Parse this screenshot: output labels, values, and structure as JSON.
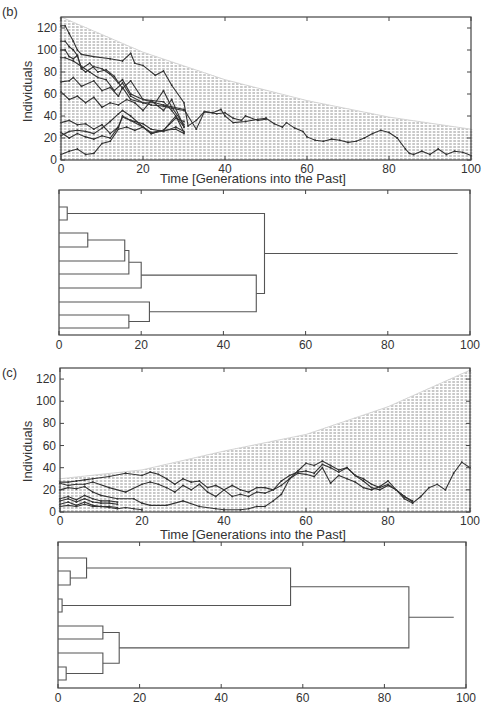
{
  "chart_data": [
    {
      "id": "b-lineages",
      "type": "line",
      "panel_label": "(b)",
      "title": "",
      "xlabel": "Time [Generations into the Past]",
      "ylabel": "Individuals",
      "xlim": [
        0,
        100
      ],
      "ylim": [
        0,
        130
      ],
      "xticks": [
        0,
        20,
        40,
        60,
        80,
        100
      ],
      "yticks": [
        0,
        20,
        40,
        60,
        80,
        100,
        120
      ],
      "background_envelope": {
        "description": "Gray vertical hatching showing population size per generation (decreasing into the past)",
        "x": [
          0,
          20,
          40,
          60,
          80,
          100
        ],
        "upper": [
          130,
          98,
          73,
          54,
          39,
          28
        ]
      },
      "series": [
        {
          "name": "lineage-1",
          "x": [
            0,
            1,
            2,
            3,
            4,
            5,
            8,
            12,
            15,
            17,
            18,
            20,
            23,
            25,
            27,
            30,
            31,
            33,
            35,
            37,
            39,
            40,
            42,
            45,
            48,
            50
          ],
          "y": [
            122,
            122,
            115,
            108,
            100,
            96,
            94,
            92,
            90,
            97,
            88,
            86,
            77,
            81,
            68,
            52,
            31,
            36,
            44,
            43,
            46,
            40,
            34,
            35,
            37,
            38
          ]
        },
        {
          "name": "lineage-2",
          "x": [
            0,
            1,
            2,
            3,
            4,
            5,
            6,
            8,
            10,
            12,
            14,
            15,
            17,
            20,
            25,
            30,
            33,
            35,
            38,
            40,
            42,
            44,
            45,
            48,
            50
          ],
          "y": [
            108,
            108,
            103,
            100,
            95,
            83,
            80,
            85,
            83,
            78,
            70,
            73,
            60,
            55,
            50,
            46,
            28,
            44,
            42,
            43,
            38,
            36,
            40,
            36,
            37
          ]
        },
        {
          "name": "lineage-3",
          "x": [
            0,
            1,
            2,
            3,
            4,
            5,
            7,
            9,
            11,
            13,
            15,
            17,
            20,
            25,
            27,
            30
          ],
          "y": [
            100,
            100,
            94,
            92,
            95,
            83,
            88,
            80,
            82,
            76,
            65,
            72,
            55,
            53,
            45,
            30
          ]
        },
        {
          "name": "lineage-4",
          "x": [
            0,
            1,
            3,
            5,
            7,
            9,
            11,
            13,
            15,
            17,
            20,
            23,
            25,
            27,
            30
          ],
          "y": [
            93,
            93,
            90,
            85,
            80,
            75,
            73,
            63,
            70,
            58,
            52,
            52,
            63,
            48,
            32
          ]
        },
        {
          "name": "lineage-5",
          "x": [
            0,
            2,
            3,
            5,
            8,
            10,
            12,
            14,
            15,
            17,
            20,
            22,
            25,
            27,
            30
          ],
          "y": [
            71,
            72,
            75,
            67,
            72,
            63,
            66,
            58,
            66,
            55,
            52,
            50,
            49,
            47,
            45
          ]
        },
        {
          "name": "lineage-6",
          "x": [
            0,
            2,
            4,
            6,
            8,
            10,
            12,
            14,
            16,
            18,
            20,
            22,
            25,
            27,
            30
          ],
          "y": [
            62,
            55,
            58,
            52,
            57,
            48,
            52,
            50,
            55,
            52,
            45,
            54,
            45,
            55,
            30
          ]
        },
        {
          "name": "lineage-7",
          "x": [
            0,
            2,
            4,
            6,
            8,
            10,
            12,
            14,
            15,
            17,
            20,
            22,
            25,
            28,
            30
          ],
          "y": [
            34,
            36,
            32,
            33,
            28,
            32,
            24,
            30,
            40,
            36,
            33,
            28,
            26,
            30,
            26
          ]
        },
        {
          "name": "lineage-8",
          "x": [
            0,
            2,
            4,
            6,
            8,
            10,
            12,
            14,
            15,
            17,
            20,
            22,
            25,
            28,
            30
          ],
          "y": [
            25,
            20,
            24,
            21,
            19,
            22,
            20,
            30,
            39,
            36,
            30,
            24,
            27,
            28,
            24
          ]
        },
        {
          "name": "lineage-9",
          "x": [
            0,
            2,
            4,
            6,
            8,
            10,
            12,
            14,
            15,
            17,
            20,
            22,
            25,
            28,
            30
          ],
          "y": [
            22,
            26,
            27,
            26,
            24,
            29,
            35,
            42,
            45,
            40,
            30,
            24,
            27,
            40,
            25
          ]
        },
        {
          "name": "lineage-10",
          "x": [
            0,
            2,
            4,
            6,
            8,
            10,
            12,
            14,
            16,
            18,
            20,
            22,
            25,
            28,
            30
          ],
          "y": [
            5,
            8,
            10,
            5,
            6,
            15,
            17,
            28,
            30,
            27,
            30,
            25,
            27,
            38,
            35
          ]
        },
        {
          "name": "ancestral-lineage",
          "x": [
            50,
            52,
            54,
            55,
            57,
            59,
            60,
            62,
            64,
            66,
            68,
            70,
            72,
            74,
            76,
            78,
            80,
            82,
            84,
            85,
            86,
            88,
            90,
            92,
            94,
            96,
            98,
            100
          ],
          "y": [
            38,
            33,
            30,
            34,
            29,
            26,
            21,
            18,
            17,
            19,
            18,
            16,
            17,
            20,
            24,
            27,
            25,
            20,
            10,
            6,
            5,
            8,
            5,
            10,
            5,
            8,
            7,
            4
          ]
        }
      ]
    },
    {
      "id": "b-dendrogram",
      "type": "dendrogram",
      "xlim": [
        0,
        100
      ],
      "xticks": [
        0,
        20,
        40,
        60,
        80,
        100
      ],
      "leaves": 10,
      "merges": [
        {
          "leaves": [
            1,
            2
          ],
          "height": 2
        },
        {
          "leaves": [
            3,
            4
          ],
          "height": 7
        },
        {
          "leaves": [
            "(3,4)",
            5
          ],
          "height": 16
        },
        {
          "leaves": [
            "(3,4,5)",
            6
          ],
          "height": 17
        },
        {
          "leaves": [
            "(3..6)",
            7
          ],
          "height": 20
        },
        {
          "leaves": [
            9,
            10
          ],
          "height": 17
        },
        {
          "leaves": [
            8,
            "(9,10)"
          ],
          "height": 22
        },
        {
          "leaves": [
            "(3..7)",
            "(8..10)"
          ],
          "height": 48
        },
        {
          "leaves": [
            "(1,2)",
            "(3..10)"
          ],
          "height": 50
        },
        {
          "leaves": [
            "root"
          ],
          "height": 100
        }
      ]
    },
    {
      "id": "c-lineages",
      "type": "line",
      "panel_label": "(c)",
      "xlabel": "Time [Generations into the Past]",
      "ylabel": "Individuals",
      "xlim": [
        0,
        100
      ],
      "ylim": [
        0,
        130
      ],
      "xticks": [
        0,
        20,
        40,
        60,
        80,
        100
      ],
      "yticks": [
        0,
        20,
        40,
        60,
        80,
        100,
        120
      ],
      "background_envelope": {
        "description": "Gray vertical hatching showing population size per generation (increasing into the past)",
        "x": [
          0,
          20,
          40,
          60,
          80,
          100
        ],
        "upper": [
          30,
          38,
          55,
          70,
          95,
          128
        ]
      },
      "series": [
        {
          "name": "lineage-1",
          "x": [
            0,
            2,
            4,
            6,
            8,
            12,
            16,
            20,
            22,
            24,
            26,
            28,
            30,
            32,
            34,
            36,
            38,
            40,
            42,
            44,
            46,
            48,
            50,
            52,
            54,
            56,
            58,
            60,
            62,
            64,
            66,
            68,
            70,
            72,
            74,
            76,
            78,
            80,
            82,
            84,
            86
          ],
          "y": [
            27,
            27,
            28,
            29,
            30,
            32,
            35,
            33,
            36,
            34,
            30,
            25,
            30,
            27,
            28,
            22,
            24,
            20,
            24,
            20,
            18,
            22,
            22,
            20,
            24,
            30,
            37,
            44,
            42,
            46,
            42,
            38,
            40,
            33,
            30,
            25,
            22,
            25,
            20,
            14,
            10
          ]
        },
        {
          "name": "lineage-2",
          "x": [
            0,
            2,
            4,
            6,
            8,
            12,
            16,
            20,
            22,
            24,
            26,
            28,
            30,
            32,
            34,
            36,
            38,
            40,
            42,
            44,
            46,
            48,
            50,
            52,
            54,
            56,
            58,
            60,
            62,
            64,
            66,
            68,
            70,
            72,
            74,
            76,
            78,
            80,
            82,
            84,
            86
          ],
          "y": [
            26,
            24,
            25,
            25,
            27,
            22,
            18,
            25,
            27,
            25,
            22,
            18,
            24,
            20,
            25,
            18,
            14,
            20,
            14,
            16,
            14,
            18,
            17,
            20,
            28,
            33,
            36,
            37,
            35,
            43,
            40,
            36,
            40,
            33,
            28,
            22,
            20,
            24,
            20,
            14,
            9
          ]
        },
        {
          "name": "lineage-3",
          "x": [
            0,
            2,
            4,
            6,
            8,
            10,
            14,
            18,
            20,
            22,
            26,
            30,
            34,
            38,
            40,
            44,
            46,
            48,
            50,
            52,
            54,
            56,
            58,
            60,
            62,
            64,
            66,
            68,
            70,
            72,
            74,
            76,
            78,
            80,
            82,
            84,
            86,
            88,
            90,
            92,
            94,
            96,
            98,
            100
          ],
          "y": [
            20,
            22,
            21,
            23,
            18,
            15,
            12,
            12,
            8,
            6,
            6,
            10,
            5,
            3,
            2,
            2,
            3,
            5,
            5,
            10,
            16,
            30,
            35,
            34,
            32,
            40,
            26,
            33,
            30,
            27,
            22,
            20,
            23,
            28,
            20,
            12,
            8,
            14,
            22,
            25,
            20,
            35,
            45,
            40
          ]
        },
        {
          "name": "lineage-4",
          "x": [
            0,
            2,
            4,
            6,
            8,
            10,
            12,
            14
          ],
          "y": [
            12,
            14,
            11,
            15,
            12,
            10,
            10,
            9
          ]
        },
        {
          "name": "lineage-5",
          "x": [
            0,
            2,
            4,
            6,
            8,
            10,
            12,
            14
          ],
          "y": [
            10,
            12,
            9,
            12,
            9,
            8,
            8,
            7
          ]
        },
        {
          "name": "lineage-6",
          "x": [
            0,
            2,
            4,
            6,
            8,
            10,
            12,
            14
          ],
          "y": [
            7,
            9,
            6,
            9,
            6,
            5,
            5,
            4
          ]
        },
        {
          "name": "lineage-7",
          "x": [
            0,
            2,
            4,
            6,
            8,
            10,
            12,
            14,
            16,
            18,
            20
          ],
          "y": [
            5,
            6,
            5,
            7,
            5,
            5,
            4,
            3,
            4,
            3,
            2
          ]
        }
      ]
    },
    {
      "id": "c-dendrogram",
      "type": "dendrogram",
      "xlim": [
        0,
        100
      ],
      "xticks": [
        0,
        20,
        40,
        60,
        80,
        100
      ],
      "leaves": 10,
      "merges": [
        {
          "leaves": [
            2,
            3
          ],
          "height": 3
        },
        {
          "leaves": [
            1,
            "(2,3)"
          ],
          "height": 7
        },
        {
          "leaves": [
            4,
            5
          ],
          "height": 1
        },
        {
          "leaves": [
            "(1,2,3)",
            "(4,5)"
          ],
          "height": 57
        },
        {
          "leaves": [
            6,
            7
          ],
          "height": 11
        },
        {
          "leaves": [
            9,
            10
          ],
          "height": 2
        },
        {
          "leaves": [
            8,
            "(9,10)"
          ],
          "height": 11
        },
        {
          "leaves": [
            "(6,7)",
            "(8..10)"
          ],
          "height": 15
        },
        {
          "leaves": [
            "(1..5)",
            "(6..10)"
          ],
          "height": 86
        },
        {
          "leaves": [
            "root"
          ],
          "height": 100
        }
      ]
    }
  ],
  "labels": {
    "panel_b": "(b)",
    "panel_c": "(c)",
    "ylabel": "Individuals",
    "xlabel": "Time [Generations into the Past]"
  },
  "colors": {
    "envelope": "#c8c8c8",
    "line": "#333333",
    "axis": "#444444"
  }
}
